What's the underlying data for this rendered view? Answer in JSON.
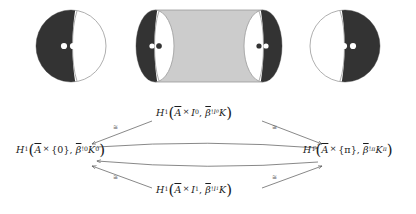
{
  "figure": {
    "caption": "",
    "colors": {
      "dark_fill": "#333333",
      "cylinder_body": "#cccccc",
      "outline": "#9a9a9a",
      "white_fill": "#ffffff"
    },
    "shapes": [
      {
        "name": "disk-left",
        "type": "disk",
        "dark_side": "left",
        "marked_points": 2,
        "marked_point_color": "#ffffff"
      },
      {
        "name": "cylinder",
        "type": "cylinder",
        "left_cap_dark_side": "left",
        "right_cap_dark_side": "right",
        "marked_points_per_cap": 2
      },
      {
        "name": "disk-right",
        "type": "disk",
        "dark_side": "right",
        "marked_points": 2,
        "marked_point_color": "#ffffff"
      }
    ]
  },
  "diagram": {
    "type": "commutative-diagram",
    "nodes": {
      "top": {
        "plain": "H^1(A-bar x I_0, beta-bar_!^{I_0} K)",
        "H": "H",
        "H_sup": "1",
        "A": "A",
        "times": "×",
        "arg": "I",
        "arg_sub": "0",
        "beta": "β",
        "beta_sub": "!",
        "beta_sup": "I",
        "beta_sup_sub": "0",
        "K": "K",
        "K_sup": ""
      },
      "bottom": {
        "plain": "H^1(A-bar x I_1, beta-bar_!^{I_1} K)",
        "H": "H",
        "H_sup": "1",
        "A": "A",
        "times": "×",
        "arg": "I",
        "arg_sub": "1",
        "beta": "β",
        "beta_sub": "!",
        "beta_sup": "I",
        "beta_sup_sub": "1",
        "K": "K",
        "K_sup": ""
      },
      "left": {
        "plain": "H^1(A-bar x {0}, beta-bar_!^{0} K^{0})",
        "H": "H",
        "H_sup": "1",
        "A": "A",
        "times": "×",
        "arg": "{0}",
        "arg_sub": "",
        "beta": "β",
        "beta_sub": "!",
        "beta_sup": "0",
        "beta_sup_sub": "",
        "K": "K",
        "K_sup": "0"
      },
      "right": {
        "plain": "H^1(A-bar x {pi}, beta-bar_!^{pi} K^{pi})",
        "H": "H",
        "H_sup": "1",
        "A": "A",
        "times": "×",
        "arg": "{π}",
        "arg_sub": "",
        "beta": "β",
        "beta_sub": "!",
        "beta_sup": "π",
        "beta_sup_sub": "",
        "K": "K",
        "K_sup": "π"
      }
    },
    "arrows": [
      {
        "name": "top-to-left",
        "label": "≅",
        "from": "top",
        "to": "left"
      },
      {
        "name": "top-to-right",
        "label": "≅",
        "from": "top",
        "to": "right"
      },
      {
        "name": "bottom-to-left",
        "label": "≅",
        "from": "bottom",
        "to": "left"
      },
      {
        "name": "bottom-to-right",
        "label": "≅",
        "from": "bottom",
        "to": "right"
      },
      {
        "name": "left-to-right-upper",
        "label": "",
        "from": "left",
        "to": "right"
      },
      {
        "name": "right-to-left-lower",
        "label": "",
        "from": "right",
        "to": "left"
      }
    ],
    "labels": {
      "tl": "≅",
      "tr": "≅",
      "bl": "≅",
      "br": "≅"
    }
  }
}
